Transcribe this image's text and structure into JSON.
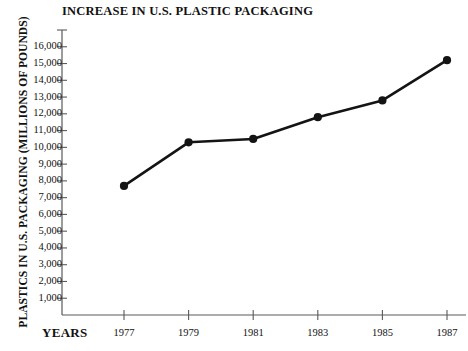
{
  "chart_data": {
    "type": "line",
    "title": "INCREASE IN U.S. PLASTIC PACKAGING",
    "xlabel": "YEARS",
    "ylabel": "PLASTICS IN U.S. PACKAGING (MILLIONS OF POUNDS)",
    "categories": [
      "1977",
      "1979",
      "1981",
      "1983",
      "1985",
      "1987"
    ],
    "x": [
      1977,
      1979,
      1981,
      1983,
      1985,
      1987
    ],
    "values": [
      7700,
      10300,
      10500,
      11800,
      12800,
      15200
    ],
    "series": [
      {
        "name": "Plastics in U.S. packaging",
        "values": [
          7700,
          10300,
          10500,
          11800,
          12800,
          15200
        ]
      }
    ],
    "ylim": [
      0,
      17000
    ],
    "xlim": [
      1976,
      1988
    ],
    "y_tick_step": 1000,
    "y_tick_labels": [
      "16,000",
      "15,000",
      "14,000",
      "13,000",
      "12,000",
      "11,000",
      "10,000",
      "9,000",
      "8,000",
      "7,000",
      "6,000",
      "5,000",
      "4,000",
      "3,000",
      "2,000",
      "1,000"
    ],
    "y_tick_values": [
      16000,
      15000,
      14000,
      13000,
      12000,
      11000,
      10000,
      9000,
      8000,
      7000,
      6000,
      5000,
      4000,
      3000,
      2000,
      1000
    ],
    "y_unlabeled_ticks": [
      17000
    ],
    "x_tick_labels": [
      "1977",
      "1979",
      "1981",
      "1983",
      "1985",
      "1987"
    ],
    "grid": false,
    "legend": false,
    "legend_position": "none",
    "line_color": "#141414",
    "marker": "circle",
    "axis_color": "#5a5a5a",
    "background_color": "#ffffff"
  }
}
